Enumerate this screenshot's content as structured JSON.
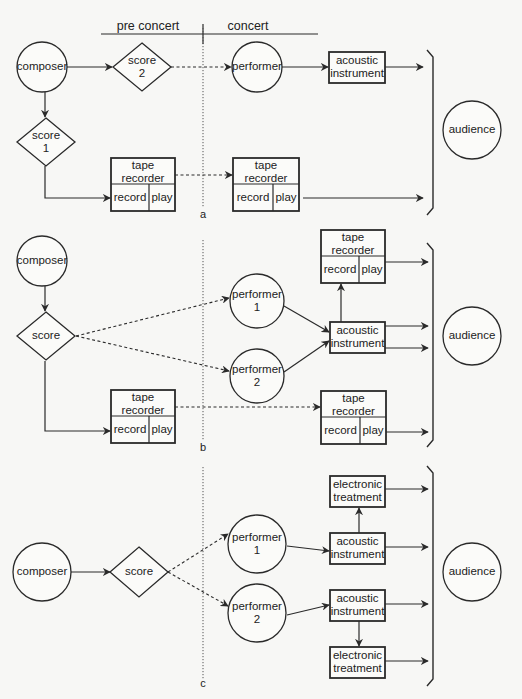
{
  "header": {
    "pre_concert": "pre concert",
    "concert": "concert"
  },
  "colors": {
    "ink": "#2a2a2a",
    "paper": "#f7f7f5"
  },
  "sections": [
    {
      "id": "a",
      "label": "a",
      "nodes": [
        {
          "id": "composer",
          "type": "circle",
          "lines": [
            "composer"
          ],
          "cx": 42,
          "cy": 67,
          "r": 25
        },
        {
          "id": "score2",
          "type": "diamond",
          "lines": [
            "score",
            "2"
          ],
          "cx": 142,
          "cy": 67,
          "w": 58,
          "h": 48
        },
        {
          "id": "performer",
          "type": "circle",
          "lines": [
            "performer"
          ],
          "cx": 257,
          "cy": 67,
          "r": 25
        },
        {
          "id": "acoustic",
          "type": "box",
          "lines": [
            "acoustic",
            "instrument"
          ],
          "x": 329,
          "y": 52,
          "w": 56,
          "h": 31
        },
        {
          "id": "score1",
          "type": "diamond",
          "lines": [
            "score",
            "1"
          ],
          "cx": 46,
          "cy": 142,
          "w": 58,
          "h": 48
        },
        {
          "id": "tape1",
          "type": "tape",
          "title": [
            "tape",
            "recorder"
          ],
          "record": "record",
          "play": "play",
          "x": 111,
          "y": 158,
          "w": 64,
          "h": 53
        },
        {
          "id": "tape2",
          "type": "tape",
          "title": [
            "tape",
            "recorder"
          ],
          "record": "record",
          "play": "play",
          "x": 233,
          "y": 158,
          "w": 66,
          "h": 53
        },
        {
          "id": "audience",
          "type": "circle",
          "lines": [
            "audience"
          ],
          "cx": 472,
          "cy": 130,
          "r": 29
        }
      ],
      "edges": [
        {
          "from": "composer",
          "to": "score2",
          "style": "solid",
          "pts": [
            [
              67,
              67
            ],
            [
              112,
              67
            ]
          ]
        },
        {
          "from": "score2",
          "to": "performer",
          "style": "dashed",
          "pts": [
            [
              171,
              67
            ],
            [
              231,
              67
            ]
          ]
        },
        {
          "from": "performer",
          "to": "acoustic",
          "style": "solid",
          "pts": [
            [
              282,
              67
            ],
            [
              328,
              67
            ]
          ]
        },
        {
          "from": "acoustic",
          "to": "audience",
          "style": "solid",
          "pts": [
            [
              385,
              67
            ],
            [
              423,
              67
            ]
          ]
        },
        {
          "from": "composer",
          "to": "score1",
          "style": "solid",
          "pts": [
            [
              45,
              92
            ],
            [
              45,
              117
            ]
          ]
        },
        {
          "from": "score1",
          "to": "tape1",
          "style": "solid",
          "pts": [
            [
              45,
              166
            ],
            [
              45,
              198
            ],
            [
              110,
              198
            ]
          ]
        },
        {
          "from": "tape1",
          "to": "tape2",
          "style": "dashed",
          "pts": [
            [
              175,
              175
            ],
            [
              232,
              175
            ]
          ]
        },
        {
          "from": "tape2",
          "to": "audience",
          "style": "solid",
          "pts": [
            [
              303,
              198
            ],
            [
              423,
              198
            ]
          ]
        }
      ],
      "divider": {
        "x": 203,
        "y1": 28,
        "y2": 208
      },
      "bracket": {
        "x": 433,
        "y1": 50,
        "y2": 215
      },
      "label_pos": [
        203,
        218
      ]
    },
    {
      "id": "b",
      "label": "b",
      "nodes": [
        {
          "id": "composer",
          "type": "circle",
          "lines": [
            "composer"
          ],
          "cx": 42,
          "cy": 261,
          "r": 25
        },
        {
          "id": "score",
          "type": "diamond",
          "lines": [
            "score"
          ],
          "cx": 46,
          "cy": 336,
          "w": 58,
          "h": 48
        },
        {
          "id": "performer1",
          "type": "circle",
          "lines": [
            "performer",
            "1"
          ],
          "cx": 257,
          "cy": 301,
          "r": 27
        },
        {
          "id": "performer2",
          "type": "circle",
          "lines": [
            "performer",
            "2"
          ],
          "cx": 257,
          "cy": 376,
          "r": 27
        },
        {
          "id": "acoustic",
          "type": "box",
          "lines": [
            "acoustic",
            "instrument"
          ],
          "x": 330,
          "y": 322,
          "w": 55,
          "h": 31
        },
        {
          "id": "tapeTop",
          "type": "tape",
          "title": [
            "tape",
            "recorder"
          ],
          "record": "record",
          "play": "play",
          "x": 321,
          "y": 230,
          "w": 64,
          "h": 53
        },
        {
          "id": "tape1",
          "type": "tape",
          "title": [
            "tape",
            "recorder"
          ],
          "record": "record",
          "play": "play",
          "x": 111,
          "y": 390,
          "w": 64,
          "h": 53
        },
        {
          "id": "tape2",
          "type": "tape",
          "title": [
            "tape",
            "recorder"
          ],
          "record": "record",
          "play": "play",
          "x": 321,
          "y": 391,
          "w": 65,
          "h": 53
        },
        {
          "id": "audience",
          "type": "circle",
          "lines": [
            "audience"
          ],
          "cx": 472,
          "cy": 336,
          "r": 29
        }
      ],
      "edges": [
        {
          "from": "composer",
          "to": "score",
          "style": "solid",
          "pts": [
            [
              45,
              286
            ],
            [
              45,
              311
            ]
          ]
        },
        {
          "from": "score",
          "to": "performer1",
          "style": "dashed",
          "pts": [
            [
              76,
              336
            ],
            [
              229,
              298
            ]
          ]
        },
        {
          "from": "score",
          "to": "performer2",
          "style": "dashed",
          "pts": [
            [
              76,
              336
            ],
            [
              229,
              371
            ]
          ]
        },
        {
          "from": "performer1",
          "to": "acoustic",
          "style": "solid",
          "pts": [
            [
              284,
              306
            ],
            [
              329,
              332
            ]
          ]
        },
        {
          "from": "performer2",
          "to": "acoustic",
          "style": "solid",
          "pts": [
            [
              284,
              372
            ],
            [
              329,
              341
            ]
          ]
        },
        {
          "from": "acoustic",
          "to": "tapeTop",
          "style": "solid",
          "pts": [
            [
              341,
              322
            ],
            [
              341,
              284
            ]
          ]
        },
        {
          "from": "tapeTop",
          "to": "audience",
          "style": "solid",
          "pts": [
            [
              385,
              262
            ],
            [
              428,
              262
            ]
          ]
        },
        {
          "from": "acoustic",
          "to": "audience",
          "style": "solid",
          "pts": [
            [
              385,
              326
            ],
            [
              428,
              326
            ]
          ]
        },
        {
          "from": "acoustic",
          "to": "audience",
          "style": "solid",
          "pts": [
            [
              385,
              348
            ],
            [
              428,
              348
            ]
          ]
        },
        {
          "from": "score",
          "to": "tape1",
          "style": "solid",
          "pts": [
            [
              45,
              361
            ],
            [
              45,
              431
            ],
            [
              110,
              431
            ]
          ]
        },
        {
          "from": "tape1",
          "to": "tape2",
          "style": "dashed",
          "pts": [
            [
              175,
              407
            ],
            [
              320,
              407
            ]
          ]
        },
        {
          "from": "tape2",
          "to": "audience",
          "style": "solid",
          "pts": [
            [
              386,
              432
            ],
            [
              428,
              432
            ]
          ]
        }
      ],
      "divider": {
        "x": 203,
        "y1": 240,
        "y2": 440
      },
      "bracket": {
        "x": 433,
        "y1": 243,
        "y2": 447
      },
      "label_pos": [
        203,
        451
      ]
    },
    {
      "id": "c",
      "label": "c",
      "nodes": [
        {
          "id": "composer",
          "type": "circle",
          "lines": [
            "composer"
          ],
          "cx": 42,
          "cy": 572,
          "r": 29
        },
        {
          "id": "score",
          "type": "diamond",
          "lines": [
            "score"
          ],
          "cx": 139,
          "cy": 572,
          "w": 58,
          "h": 50
        },
        {
          "id": "performer1",
          "type": "circle",
          "lines": [
            "performer",
            "1"
          ],
          "cx": 257,
          "cy": 544,
          "r": 29
        },
        {
          "id": "performer2",
          "type": "circle",
          "lines": [
            "performer",
            "2"
          ],
          "cx": 257,
          "cy": 613,
          "r": 29
        },
        {
          "id": "elec1",
          "type": "box",
          "lines": [
            "electronic",
            "treatment"
          ],
          "x": 330,
          "y": 476,
          "w": 55,
          "h": 31
        },
        {
          "id": "acoustic1",
          "type": "box",
          "lines": [
            "acoustic",
            "instrument"
          ],
          "x": 330,
          "y": 533,
          "w": 55,
          "h": 31
        },
        {
          "id": "acoustic2",
          "type": "box",
          "lines": [
            "acoustic",
            "instrument"
          ],
          "x": 330,
          "y": 590,
          "w": 55,
          "h": 31
        },
        {
          "id": "elec2",
          "type": "box",
          "lines": [
            "electronic",
            "treatment"
          ],
          "x": 330,
          "y": 647,
          "w": 55,
          "h": 31
        },
        {
          "id": "audience",
          "type": "circle",
          "lines": [
            "audience"
          ],
          "cx": 472,
          "cy": 572,
          "r": 29
        }
      ],
      "edges": [
        {
          "from": "composer",
          "to": "score",
          "style": "solid",
          "pts": [
            [
              71,
              572
            ],
            [
              110,
              572
            ]
          ]
        },
        {
          "from": "score",
          "to": "performer1",
          "style": "dashed",
          "pts": [
            [
              168,
              572
            ],
            [
              228,
              534
            ]
          ]
        },
        {
          "from": "score",
          "to": "performer2",
          "style": "dashed",
          "pts": [
            [
              168,
              572
            ],
            [
              228,
              606
            ]
          ]
        },
        {
          "from": "performer1",
          "to": "acoustic1",
          "style": "solid",
          "pts": [
            [
              287,
              546
            ],
            [
              329,
              551
            ]
          ]
        },
        {
          "from": "performer2",
          "to": "acoustic2",
          "style": "solid",
          "pts": [
            [
              287,
              615
            ],
            [
              329,
              605
            ]
          ]
        },
        {
          "from": "acoustic1",
          "to": "elec1",
          "style": "solid",
          "pts": [
            [
              359,
              533
            ],
            [
              359,
              508
            ]
          ]
        },
        {
          "from": "acoustic2",
          "to": "elec2",
          "style": "solid",
          "pts": [
            [
              359,
              621
            ],
            [
              359,
              646
            ]
          ]
        },
        {
          "from": "elec1",
          "to": "audience",
          "style": "solid",
          "pts": [
            [
              385,
              489
            ],
            [
              428,
              489
            ]
          ]
        },
        {
          "from": "acoustic1",
          "to": "audience",
          "style": "solid",
          "pts": [
            [
              385,
              547
            ],
            [
              428,
              547
            ]
          ]
        },
        {
          "from": "acoustic2",
          "to": "audience",
          "style": "solid",
          "pts": [
            [
              385,
              604
            ],
            [
              428,
              604
            ]
          ]
        },
        {
          "from": "elec2",
          "to": "audience",
          "style": "solid",
          "pts": [
            [
              385,
              661
            ],
            [
              428,
              661
            ]
          ]
        }
      ],
      "divider": {
        "x": 203,
        "y1": 467,
        "y2": 680
      },
      "bracket": {
        "x": 433,
        "y1": 466,
        "y2": 686
      },
      "label_pos": [
        203,
        687
      ]
    }
  ]
}
